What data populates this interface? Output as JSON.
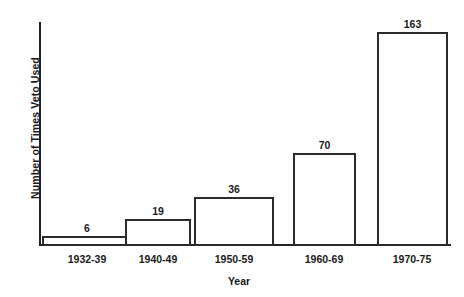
{
  "chart_data": {
    "type": "bar",
    "title": "",
    "xlabel": "Year",
    "ylabel": "Number of Times Veto Used",
    "categories": [
      "1932-39",
      "1940-49",
      "1950-59",
      "1960-69",
      "1970-75"
    ],
    "values": [
      6,
      19,
      36,
      70,
      163
    ],
    "value_labels": [
      "6",
      "19",
      "36",
      "70",
      "163"
    ],
    "ylim": [
      0,
      163
    ],
    "grid": false,
    "legend": null,
    "bar_style": {
      "fill": "#ffffff",
      "outline": "#2b2b2b",
      "outline_width_px": 2
    },
    "axis_color": "#222222",
    "background": "#ffffff"
  },
  "layout": {
    "bars": [
      {
        "left_px": 42,
        "width_px": 90,
        "label_center_px": 87
      },
      {
        "left_px": 125,
        "width_px": 66,
        "label_center_px": 158
      },
      {
        "left_px": 194,
        "width_px": 80,
        "label_center_px": 234
      },
      {
        "left_px": 293,
        "width_px": 63,
        "label_center_px": 324
      },
      {
        "left_px": 377,
        "width_px": 71,
        "label_center_px": 412
      }
    ],
    "pixels_per_unit": 1.3
  }
}
